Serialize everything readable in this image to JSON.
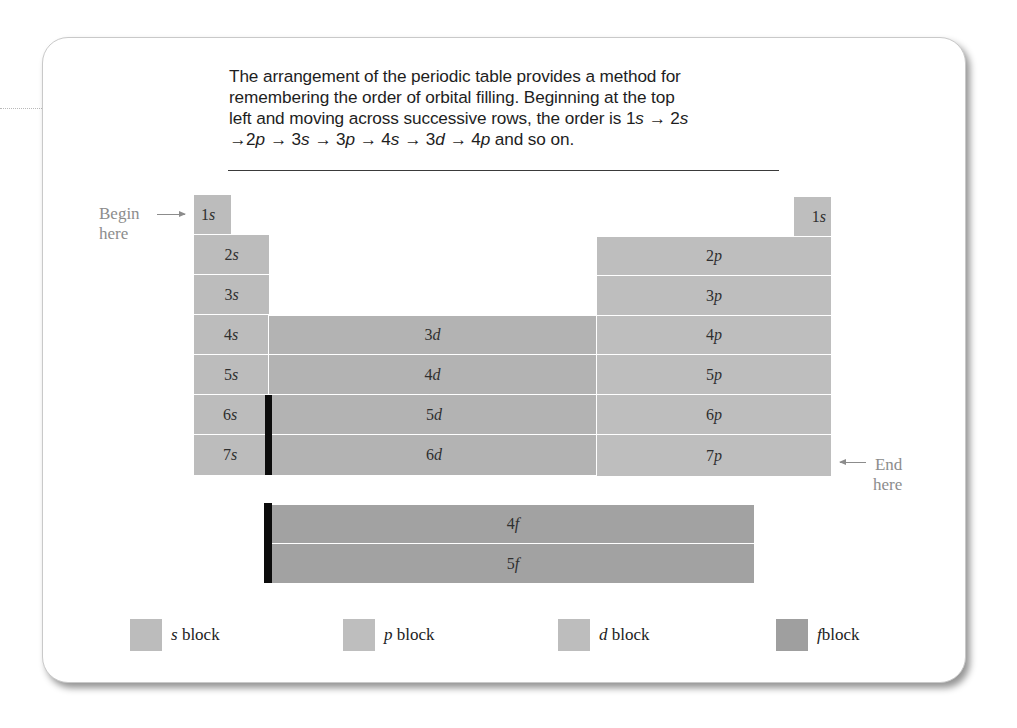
{
  "caption": {
    "line1": "The arrangement of the periodic table provides a method for",
    "line2": "remembering the order of orbital filling. Beginning at the top",
    "line3_prefix": "left and moving across successive rows, the order is ",
    "sequence": [
      {
        "n": "1",
        "l": "s"
      },
      {
        "n": "2",
        "l": "s"
      },
      {
        "n": "2",
        "l": "p"
      },
      {
        "n": "3",
        "l": "s"
      },
      {
        "n": "3",
        "l": "p"
      },
      {
        "n": "4",
        "l": "s"
      },
      {
        "n": "3",
        "l": "d"
      },
      {
        "n": "4",
        "l": "p"
      }
    ],
    "arrow_glyph": "→",
    "suffix": " and so on."
  },
  "labels": {
    "begin_line1": "Begin",
    "begin_line2": "here",
    "end_line1": "End",
    "end_line2": "here"
  },
  "blocks": {
    "s": [
      {
        "n": "1",
        "l": "s"
      },
      {
        "n": "2",
        "l": "s"
      },
      {
        "n": "3",
        "l": "s"
      },
      {
        "n": "4",
        "l": "s"
      },
      {
        "n": "5",
        "l": "s"
      },
      {
        "n": "6",
        "l": "s"
      },
      {
        "n": "7",
        "l": "s"
      }
    ],
    "helium": {
      "n": "1",
      "l": "s"
    },
    "p": [
      {
        "n": "2",
        "l": "p"
      },
      {
        "n": "3",
        "l": "p"
      },
      {
        "n": "4",
        "l": "p"
      },
      {
        "n": "5",
        "l": "p"
      },
      {
        "n": "6",
        "l": "p"
      },
      {
        "n": "7",
        "l": "p"
      }
    ],
    "d": [
      {
        "n": "3",
        "l": "d"
      },
      {
        "n": "4",
        "l": "d"
      },
      {
        "n": "5",
        "l": "d"
      },
      {
        "n": "6",
        "l": "d"
      }
    ],
    "f": [
      {
        "n": "4",
        "l": "f"
      },
      {
        "n": "5",
        "l": "f"
      }
    ]
  },
  "legend": [
    {
      "key": "s",
      "letter": "s",
      "text": " block",
      "color": "#bcbcbc"
    },
    {
      "key": "p",
      "letter": "p",
      "text": " block",
      "color": "#bebebe"
    },
    {
      "key": "d",
      "letter": "d",
      "text": " block",
      "color": "#bdbdbd"
    },
    {
      "key": "f",
      "letter": "f",
      "text": "block",
      "color": "#9f9f9f"
    }
  ],
  "colors": {
    "s_block": "#bcbcbc",
    "p_block": "#bebebe",
    "d_block": "#b3b3b3",
    "f_block": "#a2a2a2",
    "separator_bar": "#0c0c0c",
    "label_gray": "#8c8c8c"
  }
}
